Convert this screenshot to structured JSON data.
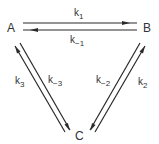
{
  "diagram": {
    "type": "reaction-scheme",
    "nodes": {
      "A": "A",
      "B": "B",
      "C": "C"
    },
    "edges": [
      {
        "from": "A",
        "to": "B",
        "rate": "k",
        "sub": "1"
      },
      {
        "from": "B",
        "to": "A",
        "rate": "k",
        "sub": "−1"
      },
      {
        "from": "B",
        "to": "C",
        "rate": "k",
        "sub": "−2"
      },
      {
        "from": "C",
        "to": "B",
        "rate": "k",
        "sub": "2"
      },
      {
        "from": "C",
        "to": "A",
        "rate": "k",
        "sub": "3"
      },
      {
        "from": "A",
        "to": "C",
        "rate": "k",
        "sub": "−3"
      }
    ],
    "colors": {
      "ink": "#333333",
      "background": "#ffffff"
    }
  }
}
